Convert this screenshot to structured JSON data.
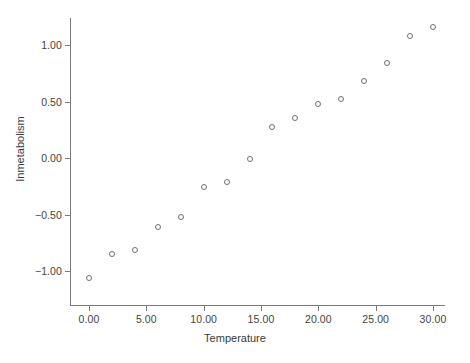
{
  "chart_data": {
    "type": "scatter",
    "title": "",
    "xlabel": "Temperature",
    "ylabel": "Inmetabolism",
    "xlim": [
      -1.5,
      31.5
    ],
    "ylim": [
      -1.28,
      1.32
    ],
    "grid": false,
    "legend": null,
    "marker": "open-circle",
    "marker_color": "#6e6e78",
    "x": [
      0,
      2,
      4,
      6,
      8,
      10,
      12,
      14,
      16,
      18,
      20,
      22,
      24,
      26,
      28,
      30
    ],
    "y": [
      -1.06,
      -0.85,
      -0.81,
      -0.61,
      -0.52,
      -0.26,
      -0.21,
      -0.01,
      0.27,
      0.35,
      0.48,
      0.52,
      0.68,
      0.84,
      1.08,
      1.16
    ],
    "points": [
      {
        "x": 0,
        "y": -1.06
      },
      {
        "x": 2,
        "y": -0.85
      },
      {
        "x": 4,
        "y": -0.81
      },
      {
        "x": 6,
        "y": -0.61
      },
      {
        "x": 8,
        "y": -0.52
      },
      {
        "x": 10,
        "y": -0.26
      },
      {
        "x": 12,
        "y": -0.21
      },
      {
        "x": 14,
        "y": -0.01
      },
      {
        "x": 16,
        "y": 0.27
      },
      {
        "x": 18,
        "y": 0.35
      },
      {
        "x": 20,
        "y": 0.48
      },
      {
        "x": 22,
        "y": 0.52
      },
      {
        "x": 24,
        "y": 0.68
      },
      {
        "x": 26,
        "y": 0.84
      },
      {
        "x": 28,
        "y": 1.08
      },
      {
        "x": 30,
        "y": 1.16
      }
    ],
    "xticks": [
      0,
      5,
      10,
      15,
      20,
      25,
      30
    ],
    "xticklabels": [
      "0.00",
      "5.00",
      "10.00",
      "15.00",
      "20.00",
      "25.00",
      "30.00"
    ],
    "yticks": [
      1.0,
      0.5,
      0.0,
      -0.5,
      -1.0
    ],
    "yticklabels": [
      "1.00",
      "0.50",
      "0.00",
      "−0.50",
      "−1.00"
    ],
    "axis_color": "#7a7a7a",
    "background_color": "#ffffff"
  },
  "axes": {
    "x_title": "Temperature",
    "y_title": "Inmetabolism"
  }
}
